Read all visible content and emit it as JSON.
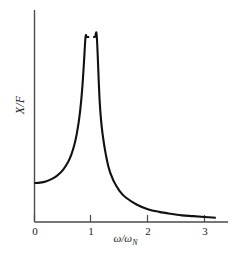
{
  "figure": {
    "background_color": "#ffffff",
    "line_color": "#111111",
    "axis_color": "#4a4a4a",
    "text_color": "#1a1a1a"
  },
  "axes": {
    "y_label_text": "X/F",
    "x_label_main": "ω/ω",
    "x_label_sub": "N",
    "x_tick_labels": [
      "0",
      "1",
      "2",
      "3"
    ]
  },
  "chart_data": {
    "type": "line",
    "title": "",
    "subtitle": "",
    "xlabel": "ω/ω_N",
    "ylabel": "X/F",
    "xlim": [
      0,
      3.35
    ],
    "ylim": [
      0,
      5.5
    ],
    "xticks": [
      0,
      1,
      2,
      3
    ],
    "xtick_labels": [
      "0",
      "1",
      "2",
      "3"
    ],
    "yticks": [],
    "ytick_labels": [],
    "grid": false,
    "legend": null,
    "annotations": [],
    "series": [
      {
        "name": "Undamped magnification factor X/F = 1/|1-(ω/ω_N)^2|",
        "color": "#111111",
        "line_width": 2,
        "asymptote_x": 1.0,
        "clipped_at_y": 5.2,
        "branches": [
          {
            "name": "sub-resonant",
            "x": [
              0.0,
              0.1,
              0.2,
              0.3,
              0.4,
              0.5,
              0.6,
              0.65,
              0.7,
              0.75,
              0.8,
              0.84,
              0.87,
              0.9,
              0.92,
              0.94,
              0.955,
              0.965
            ],
            "y": [
              1.0,
              1.01,
              1.04,
              1.1,
              1.19,
              1.33,
              1.56,
              1.73,
              1.96,
              2.29,
              2.78,
              3.38,
              4.02,
              5.26,
              6.51,
              8.58,
              11.2,
              14.3
            ]
          },
          {
            "name": "super-resonant",
            "x": [
              1.035,
              1.05,
              1.07,
              1.1,
              1.15,
              1.2,
              1.3,
              1.4,
              1.5,
              1.6,
              1.8,
              2.0,
              2.2,
              2.4,
              2.6,
              2.8,
              3.0,
              3.2
            ],
            "y": [
              13.8,
              9.76,
              6.77,
              4.76,
              3.1,
              2.27,
              1.44,
              1.04,
              0.8,
              0.64,
              0.45,
              0.33,
              0.26,
              0.21,
              0.17,
              0.15,
              0.13,
              0.11
            ]
          }
        ]
      }
    ]
  }
}
